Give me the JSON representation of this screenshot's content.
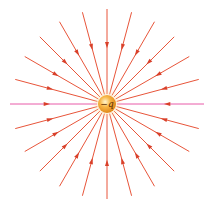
{
  "diagram": {
    "charge": {
      "label": "−q",
      "sign": "negative",
      "center": [
        107,
        104
      ],
      "radius": 9,
      "colors": {
        "inner": "#fff2c0",
        "mid": "#f7b544",
        "outer": "#e08a1a"
      }
    },
    "field_lines": {
      "count": 24,
      "angle_step_deg": 15,
      "length": 95,
      "direction": "inward",
      "line_color": "#e8553a",
      "horizontal_line_color": "#e85aa8",
      "arrow_color": "#d9402a"
    }
  }
}
